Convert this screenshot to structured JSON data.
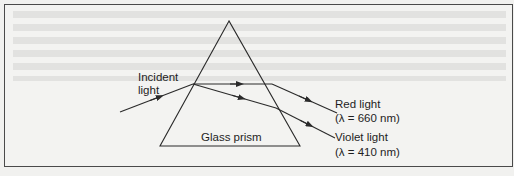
{
  "figure": {
    "labels": {
      "incident_line1": "Incident",
      "incident_line2": "light",
      "prism": "Glass prism",
      "red_name": "Red light",
      "red_wavelength": "(λ = 660 nm)",
      "violet_name": "Violet light",
      "violet_wavelength": "(λ = 410 nm)"
    },
    "colors": {
      "line": "#2a2a2a",
      "background": "#f3f3f1",
      "frame": "#4a4a4a"
    }
  }
}
